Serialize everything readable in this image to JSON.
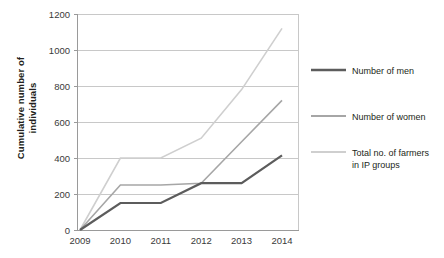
{
  "chart_data": {
    "type": "line",
    "title": "",
    "xlabel": "",
    "ylabel": "Cumulative number of individuals",
    "categories": [
      "2009",
      "2010",
      "2011",
      "2012",
      "2013",
      "2014"
    ],
    "ylim": [
      0,
      1200
    ],
    "ytick_labels": [
      "0",
      "200",
      "400",
      "600",
      "800",
      "1000",
      "1200"
    ],
    "ytick_values": [
      0,
      200,
      400,
      600,
      800,
      1000,
      1200
    ],
    "grid": true,
    "legend_position": "right",
    "series": [
      {
        "name": "Number of men",
        "color": "#5c5c5c",
        "values": [
          0,
          150,
          150,
          260,
          260,
          415
        ]
      },
      {
        "name": "Number of women",
        "color": "#a6a6a6",
        "values": [
          0,
          250,
          250,
          260,
          490,
          720
        ]
      },
      {
        "name": "Total no. of farmers in IP groups",
        "color": "#cfcfcf",
        "values": [
          0,
          400,
          400,
          510,
          780,
          1120
        ]
      }
    ]
  },
  "axis": {
    "y_title_line1": "Cumulative number of",
    "y_title_line2": "individuals"
  },
  "legend": {
    "items": [
      {
        "label": "Number of men",
        "color": "#5c5c5c"
      },
      {
        "label": "Number of women",
        "color": "#a6a6a6"
      },
      {
        "label_line1": "Total no. of farmers",
        "label_line2": "in IP groups",
        "color": "#cfcfcf"
      }
    ]
  },
  "colors": {
    "men": "#5c5c5c",
    "women": "#a6a6a6",
    "total": "#cfcfcf",
    "grid": "#c8c8c8",
    "axis": "#9a9a9a",
    "text": "#231f20"
  }
}
